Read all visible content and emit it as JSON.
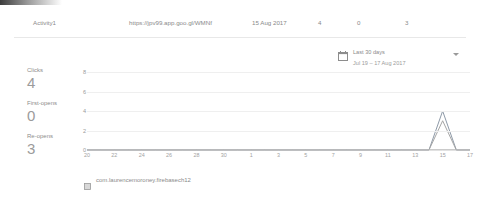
{
  "row": {
    "name": "Activity1",
    "url": "https://jpv99.app.goo.gl/WMNf",
    "date": "15 Aug 2017",
    "clicks": "4",
    "first_opens": "0",
    "re_opens": "3"
  },
  "date_range": {
    "preset_label": "Last 30 days",
    "range_label": "Jul 19 – 17 Aug 2017",
    "calendar_icon": "calendar-icon",
    "caret_icon": "chevron-down-icon"
  },
  "metrics": [
    {
      "label": "Clicks",
      "value": "4"
    },
    {
      "label": "First-opens",
      "value": "0"
    },
    {
      "label": "Re-opens",
      "value": "3"
    }
  ],
  "footer": {
    "app_icon": "android-app-icon",
    "package": "com.laurencemoroney.firebasech12"
  },
  "colors": {
    "text": "#8a8a8a",
    "value": "#9b9b9b",
    "grid": "#efefef",
    "axis": "#cfcfcf",
    "series_clicks": "#8e9aa8",
    "series_reopens": "#a6a6a6"
  },
  "chart_data": {
    "type": "line",
    "title": "",
    "xlabel": "",
    "ylabel": "",
    "ylim": [
      0,
      8
    ],
    "yticks": [
      0,
      2,
      4,
      6,
      8
    ],
    "grid": true,
    "legend": "none",
    "x": [
      "20",
      "21",
      "22",
      "23",
      "24",
      "25",
      "26",
      "27",
      "28",
      "29",
      "30",
      "31",
      "1",
      "2",
      "3",
      "4",
      "5",
      "6",
      "7",
      "8",
      "9",
      "10",
      "11",
      "12",
      "13",
      "14",
      "15",
      "16",
      "17"
    ],
    "xticks": [
      "20",
      "22",
      "24",
      "26",
      "28",
      "30",
      "1",
      "3",
      "5",
      "7",
      "9",
      "11",
      "13",
      "15",
      "17"
    ],
    "series": [
      {
        "name": "Clicks",
        "color": "#8e9aa8",
        "values": [
          0,
          0,
          0,
          0,
          0,
          0,
          0,
          0,
          0,
          0,
          0,
          0,
          0,
          0,
          0,
          0,
          0,
          0,
          0,
          0,
          0,
          0,
          0,
          0,
          0,
          0,
          4,
          0,
          0
        ]
      },
      {
        "name": "Re-opens",
        "color": "#a6a6a6",
        "values": [
          0,
          0,
          0,
          0,
          0,
          0,
          0,
          0,
          0,
          0,
          0,
          0,
          0,
          0,
          0,
          0,
          0,
          0,
          0,
          0,
          0,
          0,
          0,
          0,
          0,
          0,
          3,
          0,
          0
        ]
      },
      {
        "name": "First-opens",
        "color": "#c4c4c4",
        "values": [
          0,
          0,
          0,
          0,
          0,
          0,
          0,
          0,
          0,
          0,
          0,
          0,
          0,
          0,
          0,
          0,
          0,
          0,
          0,
          0,
          0,
          0,
          0,
          0,
          0,
          0,
          0,
          0,
          0
        ]
      }
    ]
  }
}
